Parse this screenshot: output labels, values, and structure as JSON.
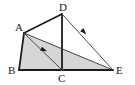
{
  "figure": {
    "type": "geometry-diagram",
    "canvas": {
      "width": 135,
      "height": 85,
      "background": "#ffffff"
    },
    "style": {
      "thick_stroke": "#1c1c1c",
      "thin_stroke": "#3a3a3a",
      "shade_fill": "#d6d6d6",
      "shade_stroke": "#b4b4b4",
      "label_color": "#1a1a1a",
      "thick_width": 1.8,
      "thin_width": 0.9
    },
    "points": [
      {
        "name": "A",
        "x": 24,
        "y": 33,
        "label": "A",
        "label_x": 15,
        "label_y": 31
      },
      {
        "name": "B",
        "x": 19,
        "y": 70,
        "label": "B",
        "label_x": 8,
        "label_y": 74
      },
      {
        "name": "C",
        "x": 62,
        "y": 70,
        "label": "C",
        "label_x": 58,
        "label_y": 82
      },
      {
        "name": "D",
        "x": 62,
        "y": 14,
        "label": "D",
        "label_x": 59,
        "label_y": 11
      },
      {
        "name": "E",
        "x": 113,
        "y": 70,
        "label": "E",
        "label_x": 116,
        "label_y": 74
      }
    ],
    "segments": [
      {
        "name": "AD",
        "from": "A",
        "to": "D",
        "weight": "thick",
        "arrow": false
      },
      {
        "name": "DC",
        "from": "D",
        "to": "C",
        "weight": "thick",
        "arrow": false
      },
      {
        "name": "BC",
        "from": "B",
        "to": "C",
        "weight": "thick",
        "arrow": false
      },
      {
        "name": "AB",
        "from": "A",
        "to": "B",
        "weight": "thick",
        "arrow": false
      },
      {
        "name": "AC",
        "from": "A",
        "to": "C",
        "weight": "thin",
        "arrow": false
      },
      {
        "name": "CE",
        "from": "C",
        "to": "E",
        "weight": "thick",
        "arrow": false
      },
      {
        "name": "AE",
        "from": "A",
        "to": "E",
        "weight": "thin",
        "arrow": true
      },
      {
        "name": "DE",
        "from": "D",
        "to": "E",
        "weight": "thin",
        "arrow": true
      }
    ],
    "shaded_region": {
      "name": "region-ABCE",
      "vertices": [
        "A",
        "B",
        "C",
        "E"
      ],
      "fill": "#d6d6d6"
    },
    "arrow_marks": [
      {
        "name": "arrow-on-AE",
        "x": 44,
        "y": 50,
        "angle": 23
      },
      {
        "name": "arrow-on-DE",
        "x": 84,
        "y": 32,
        "angle": 45
      }
    ]
  }
}
